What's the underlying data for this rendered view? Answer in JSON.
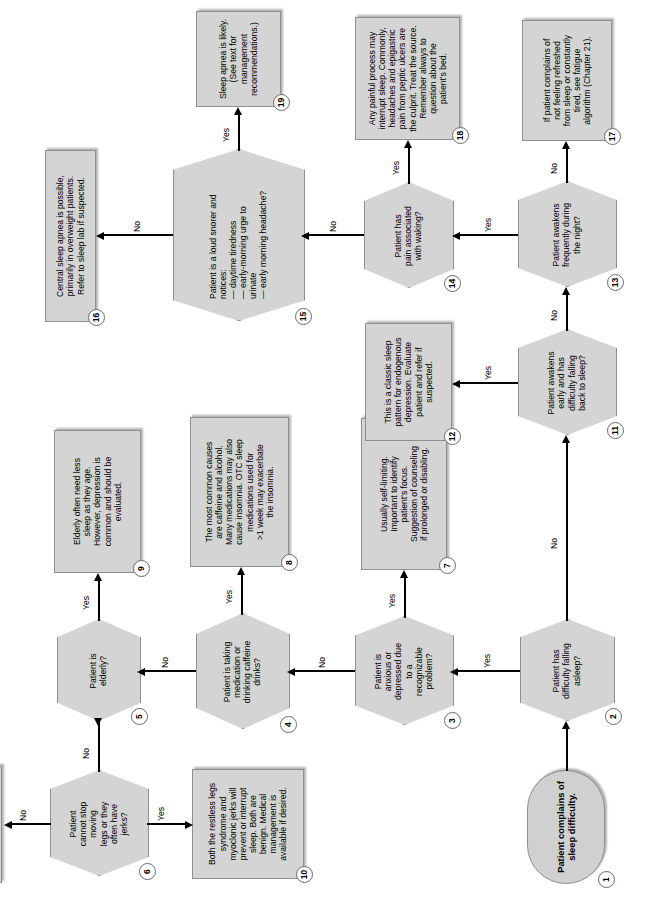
{
  "diagram": {
    "colors": {
      "node_fill": "#d4d4d4",
      "node_border": "#8f8f8f",
      "line": "#000000",
      "page_background": "#ffffff"
    }
  },
  "nodes": [
    {
      "id": "1",
      "type": "terminator",
      "text": "Patient complains of\nsleep difficulty."
    },
    {
      "id": "2",
      "type": "decision",
      "text": "Patient has\ndifficulty falling\nasleep?"
    },
    {
      "id": "3",
      "type": "decision",
      "text": "Patient is\nanxious or\ndepressed due\nto a\nrecognizable\nproblem?"
    },
    {
      "id": "4",
      "type": "decision",
      "text": "Patient is taking\nmedication or\ndrinking caffeine\ndrinks?"
    },
    {
      "id": "5",
      "type": "decision",
      "text": "Patient is\nelderly?"
    },
    {
      "id": "6",
      "type": "decision",
      "text": "Patient\ncannot stop\nmoving\nlegs or they\noften have\njerks?"
    },
    {
      "id": "7",
      "type": "process",
      "text": "Usually self-limiting.\nImportant to identify\npatient's focus.\nSuggestion of counseling\nif prolonged or disabling."
    },
    {
      "id": "8",
      "type": "process",
      "text": "The most common causes\nare caffeine and alcohol.\nMany medications may also\ncause insomnia. OTC sleep\nmedications used for\n>1 week may exacerbate\nthe insomnia."
    },
    {
      "id": "9",
      "type": "process",
      "text": "Elderly often need less\nsleep as they age.\nHowever, depression is\ncommon and should be\nevaluated."
    },
    {
      "id": "10",
      "type": "process",
      "text": "Both the restless legs\nsyndrome and\nmyoclonic jerks will\nprevent or interrupt\nsleep. Both are\nbenign. Medical\nmanagement is\navailable if desired."
    },
    {
      "id": "11",
      "type": "decision",
      "text": "Patient awakens\nearly and has\ndifficulty falling\nback to sleep?"
    },
    {
      "id": "12",
      "type": "process",
      "text": "This is a classic sleep\npattern for endogenous\ndepression. Evaluate\npatient and refer if\nsuspected."
    },
    {
      "id": "13",
      "type": "decision",
      "text": "Patient awakens\nfrequently during\nthe night?"
    },
    {
      "id": "14",
      "type": "decision",
      "text": "Patient has\npain associated\nwith waking?"
    },
    {
      "id": "15",
      "type": "decision",
      "text": "Patient is a loud snorer and\nnotices:\n  — daytime tiredness\n  — early-morning urge to\n     urinate\n  — early morning headache?"
    },
    {
      "id": "16",
      "type": "process",
      "text": "Central sleep apnea is possible,\nprimarily in overweight patients.\nRefer to sleep lab if suspected."
    },
    {
      "id": "17",
      "type": "process",
      "text": "If patient complains of\nnot feeling refreshed\nfrom sleep or constantly\ntired, see fatigue\nalgorithm (Chapter 21)."
    },
    {
      "id": "18",
      "type": "process",
      "text": "Any painful process may\ninterrupt sleep. Commonly,\nheadaches and epigastric\npain from peptic ulcers are\nthe culprit. Treat the source.\nRemember always to\nquestion about the\npatient's bed."
    },
    {
      "id": "19",
      "type": "process",
      "text": "Sleep apnea is likely.\n(See text for\nmanagement\nrecommendations.)"
    }
  ],
  "edges": [
    {
      "from": "1",
      "to": "2",
      "label": ""
    },
    {
      "from": "2",
      "to": "3",
      "label": "Yes"
    },
    {
      "from": "2",
      "to": "11",
      "label": "No"
    },
    {
      "from": "3",
      "to": "7",
      "label": "Yes"
    },
    {
      "from": "3",
      "to": "4",
      "label": "No"
    },
    {
      "from": "4",
      "to": "8",
      "label": "Yes"
    },
    {
      "from": "4",
      "to": "5",
      "label": "No"
    },
    {
      "from": "5",
      "to": "9",
      "label": "Yes"
    },
    {
      "from": "5",
      "to": "6",
      "label": "No"
    },
    {
      "from": "6",
      "to": "10",
      "label": "Yes"
    },
    {
      "from": "6",
      "to": "evaluate-sleep-environment",
      "label": "No"
    },
    {
      "from": "11",
      "to": "12",
      "label": "Yes"
    },
    {
      "from": "11",
      "to": "13",
      "label": "No"
    },
    {
      "from": "13",
      "to": "14",
      "label": "Yes"
    },
    {
      "from": "13",
      "to": "17",
      "label": "No"
    },
    {
      "from": "14",
      "to": "18",
      "label": "Yes"
    },
    {
      "from": "14",
      "to": "15",
      "label": "No"
    },
    {
      "from": "15",
      "to": "19",
      "label": "Yes"
    },
    {
      "from": "15",
      "to": "16",
      "label": "No"
    }
  ],
  "endbox": {
    "text": "Evaluate sleep\nenvironment and\nmake appropriate\nrecommendation."
  },
  "edge_labels": {
    "e1": "Yes",
    "e2": "No",
    "e3": "Yes",
    "e4": "No",
    "e5": "Yes",
    "e6": "No",
    "e7": "Yes",
    "e8": "No",
    "e9": "Yes",
    "e10": "No",
    "e11": "Yes",
    "e12": "No",
    "e13": "Yes",
    "e14": "No",
    "e15": "Yes",
    "e16": "No",
    "e17": "Yes",
    "e18": "No"
  }
}
